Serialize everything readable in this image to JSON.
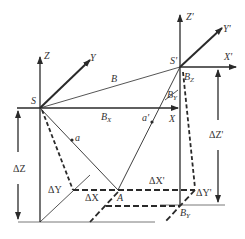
{
  "diagram": {
    "title": "",
    "colors": {
      "line": "#2a2a2a",
      "text": "#333333",
      "background": "#ffffff"
    },
    "labels": {
      "S": "S",
      "Z": "Z",
      "Y": "Y",
      "X": "X",
      "B": "B",
      "Bx_main": "B",
      "Bx_sub": "X",
      "a": "a",
      "S_prime": "S'",
      "Z_prime": "Z'",
      "Y_prime": "Y'",
      "X_prime": "X'",
      "Bz_main": "B",
      "Bz_sub": "Z",
      "By_main": "B",
      "By_sub": "Y",
      "a_prime": "a'",
      "A": "A",
      "delta_Z": "ΔZ",
      "delta_Y": "ΔY",
      "delta_X": "ΔX",
      "delta_X_prime": "ΔX'",
      "delta_Y_prime": "ΔY'",
      "delta_Z_prime": "ΔZ'",
      "BY_main": "B",
      "BY_sub": "Y"
    }
  }
}
